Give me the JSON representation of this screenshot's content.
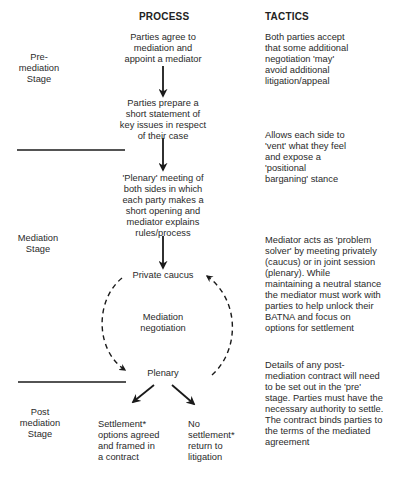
{
  "headers": {
    "process": "PROCESS",
    "tactics": "TACTICS"
  },
  "stages": {
    "pre": [
      "Pre-",
      "mediation",
      "Stage"
    ],
    "mediation": [
      "Mediation",
      "Stage"
    ],
    "post": [
      "Post",
      "mediation",
      "Stage"
    ]
  },
  "process": {
    "step1": [
      "Parties agree to",
      "mediation and",
      "appoint a mediator"
    ],
    "step2": [
      "Parties prepare a",
      "short statement of",
      "key issues in respect",
      "of their case"
    ],
    "step3": [
      "'Plenary' meeting of",
      "both sides in which",
      "each party makes a",
      "short opening and",
      "mediator explains",
      "rules/process"
    ],
    "private_caucus": "Private caucus",
    "cycle_label": [
      "Mediation",
      "negotiation"
    ],
    "plenary": "Plenary",
    "outcome_settlement": [
      "Settlement*",
      "options agreed",
      "and framed in",
      "a contract"
    ],
    "outcome_no_settlement": [
      "No",
      "settlement*",
      "return to",
      "litigation"
    ]
  },
  "tactics": {
    "t1": [
      "Both parties accept",
      "that some additional",
      "negotiation 'may'",
      "avoid additional",
      "litigation/appeal"
    ],
    "t2": [
      "Allows each side to",
      "'vent' what they feel",
      "and expose a",
      "'positional",
      "barganing' stance"
    ],
    "t3": [
      "Mediator acts as 'problem",
      "solver' by meeting privately",
      "(caucus) or in joint session",
      "(plenary). While",
      "maintaining a neutral stance",
      "the mediator must work with",
      "parties to help unlock their",
      "BATNA and focus on",
      "options for settlement"
    ],
    "t4": [
      "Details of any post-",
      "mediation contract will need",
      "to be set out in the 'pre'",
      "stage. Parties must have the",
      "necessary authority to settle.",
      "The contract binds parties to",
      "the terms of the mediated",
      "agreement"
    ]
  },
  "colors": {
    "text": "#2a2a2a",
    "line": "#1a1a1a",
    "background": "#ffffff"
  }
}
